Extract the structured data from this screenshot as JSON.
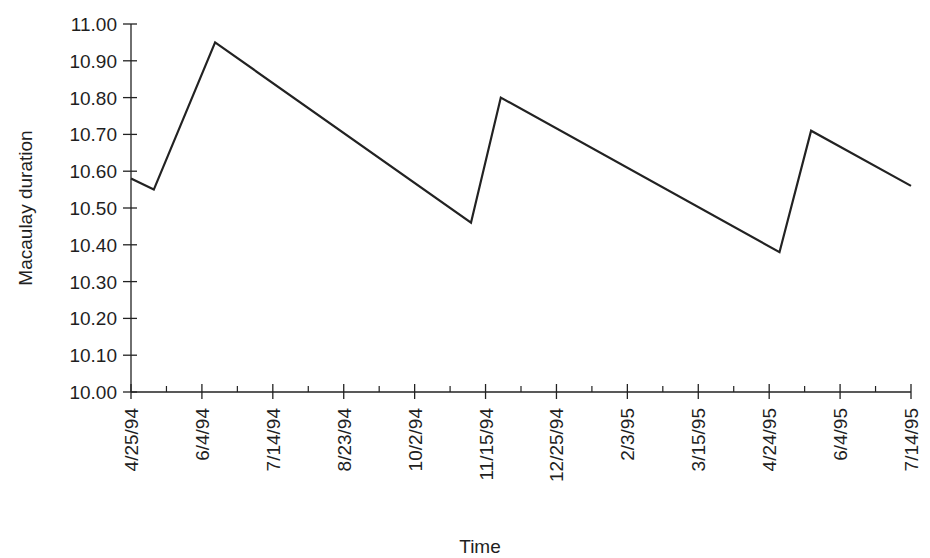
{
  "chart_data": {
    "type": "line",
    "title": "",
    "xlabel": "Time",
    "ylabel": "Macaulay duration",
    "ylim": [
      10.0,
      11.0
    ],
    "yticks": [
      "10.00",
      "10.10",
      "10.20",
      "10.30",
      "10.40",
      "10.50",
      "10.60",
      "10.70",
      "10.80",
      "10.90",
      "11.00"
    ],
    "xticks": [
      "4/25/94",
      "6/4/94",
      "7/14/94",
      "8/23/94",
      "10/2/94",
      "11/15/94",
      "12/25/94",
      "2/3/95",
      "3/15/95",
      "4/24/95",
      "6/4/95",
      "7/14/95"
    ],
    "grid": false,
    "legend": null,
    "line_color": "#222222",
    "series": [
      {
        "name": "Macaulay duration",
        "x": [
          "4/25/94",
          "5/8/94",
          "6/12/94",
          "11/5/94",
          "11/22/94",
          "4/30/95",
          "5/18/95",
          "7/14/95"
        ],
        "values": [
          10.58,
          10.55,
          10.95,
          10.46,
          10.8,
          10.38,
          10.71,
          10.56
        ]
      }
    ]
  }
}
